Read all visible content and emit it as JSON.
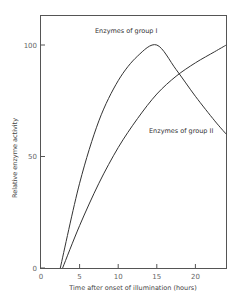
{
  "chart_data": {
    "type": "line",
    "title": "",
    "xlabel": "Time after onset of illumination (hours)",
    "ylabel": "Relative enzyme activity",
    "xlim": [
      0,
      24
    ],
    "ylim": [
      0,
      110
    ],
    "x_ticks": [
      0,
      5,
      10,
      15,
      20
    ],
    "x_tick_labels": [
      "0",
      "5",
      "10",
      "15",
      "20"
    ],
    "y_ticks": [
      0,
      50,
      100
    ],
    "y_tick_labels": [
      "0",
      "50",
      "100"
    ],
    "grid": false,
    "legend": "inline annotations",
    "series": [
      {
        "name": "Enzymes of group I",
        "label": "Enzymes of group I",
        "x": [
          2.5,
          5,
          7.5,
          10,
          12.5,
          15,
          17.5,
          20,
          22.5,
          24
        ],
        "y": [
          0,
          38,
          66,
          84,
          95,
          100,
          89,
          77,
          66,
          60
        ]
      },
      {
        "name": "Enzymes of group II",
        "label": "Enzymes of group II",
        "x": [
          2.8,
          5,
          7.5,
          10,
          12.5,
          15,
          17.5,
          20,
          22.5,
          24
        ],
        "y": [
          0,
          19,
          38,
          54,
          67,
          78,
          86,
          92,
          97,
          100
        ]
      }
    ]
  }
}
